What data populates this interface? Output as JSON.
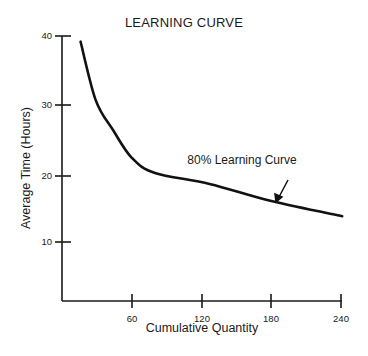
{
  "chart_data": {
    "type": "line",
    "title": "LEARNING CURVE",
    "xlabel": "Cumulative Quantity",
    "ylabel": "Average Time (Hours)",
    "xlim": [
      0,
      240
    ],
    "ylim": [
      0,
      40
    ],
    "x_ticks": [
      60,
      120,
      180,
      240
    ],
    "y_ticks": [
      10,
      20,
      30,
      40
    ],
    "grid": false,
    "legend": null,
    "series": [
      {
        "name": "80% Learning Curve",
        "x": [
          16,
          29,
          44,
          60,
          80,
          127,
          180,
          241
        ],
        "values": [
          39.2,
          30.7,
          26.3,
          22.3,
          20.1,
          18.5,
          16.0,
          13.8
        ]
      }
    ],
    "annotations": [
      {
        "text": "80% Learning Curve",
        "arrow_to": {
          "x": 180,
          "y": 16.0
        }
      }
    ]
  },
  "labels": {
    "title": "LEARNING CURVE",
    "xlabel": "Cumulative Quantity",
    "ylabel": "Average Time (Hours)",
    "annotation": "80% Learning Curve",
    "y_ticks": [
      "40",
      "30",
      "20",
      "10"
    ],
    "x_ticks": [
      "60",
      "120",
      "180",
      "240"
    ]
  }
}
